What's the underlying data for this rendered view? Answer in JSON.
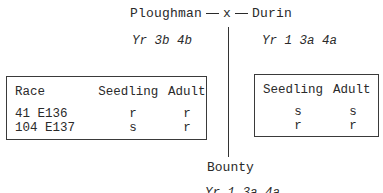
{
  "cross": {
    "parent_left": "Ploughman",
    "cross_symbol": "x",
    "parent_right": "Durin",
    "genes_left": "Yr 3b 4b",
    "genes_right": "Yr 1 3a 4a",
    "offspring": "Bounty",
    "offspring_genes": "Yr 1 3a 4a"
  },
  "left_table": {
    "headers": [
      "Race",
      "Seedling",
      "Adult"
    ],
    "rows": [
      {
        "race": "41 E136",
        "seedling": "r",
        "adult": "r"
      },
      {
        "race": "104 E137",
        "seedling": "s",
        "adult": "r"
      }
    ]
  },
  "right_table": {
    "headers": [
      "Seedling",
      "Adult"
    ],
    "rows": [
      {
        "seedling": "s",
        "adult": "s"
      },
      {
        "seedling": "r",
        "adult": "r"
      }
    ]
  }
}
